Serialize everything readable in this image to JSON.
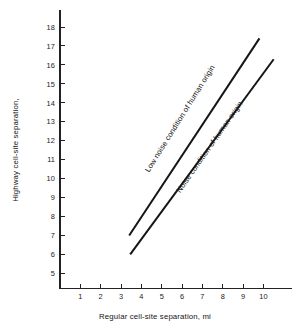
{
  "chart_data": {
    "type": "line",
    "title": "",
    "xlabel": "Regular cell-site separation, mi",
    "ylabel": "Highway cell-site separation,",
    "xlim": [
      0,
      11.4
    ],
    "ylim": [
      4.2,
      18.9
    ],
    "xticks": [
      1,
      2,
      3,
      4,
      5,
      6,
      7,
      8,
      9,
      10
    ],
    "yticks": [
      5,
      6,
      7,
      8,
      9,
      10,
      11,
      12,
      13,
      14,
      15,
      16,
      17,
      18
    ],
    "xtick_labels": [
      "1",
      "2",
      "3",
      "4",
      "5",
      "6",
      "7",
      "8",
      "9",
      "10"
    ],
    "ytick_labels": [
      "5",
      "6",
      "7",
      "8",
      "9",
      "10",
      "11",
      "12",
      "13",
      "14",
      "15",
      "16",
      "17",
      "18"
    ],
    "grid": false,
    "legend": "none",
    "line_color": "#151515",
    "background": "#ffffff",
    "series": [
      {
        "name": "Low noise condition of human origin",
        "x": [
          3.4,
          9.8
        ],
        "y": [
          7.0,
          17.4
        ]
      },
      {
        "name": "Noise condition of human origin",
        "x": [
          3.45,
          10.5
        ],
        "y": [
          6.0,
          16.3
        ]
      }
    ],
    "annotations": [
      {
        "text": "Low noise condition of human origin",
        "x": 6.0,
        "y": 13.1,
        "rotation": -58
      },
      {
        "text": "Noise condition of human origin",
        "x": 7.45,
        "y": 11.6,
        "rotation": -55
      }
    ]
  }
}
